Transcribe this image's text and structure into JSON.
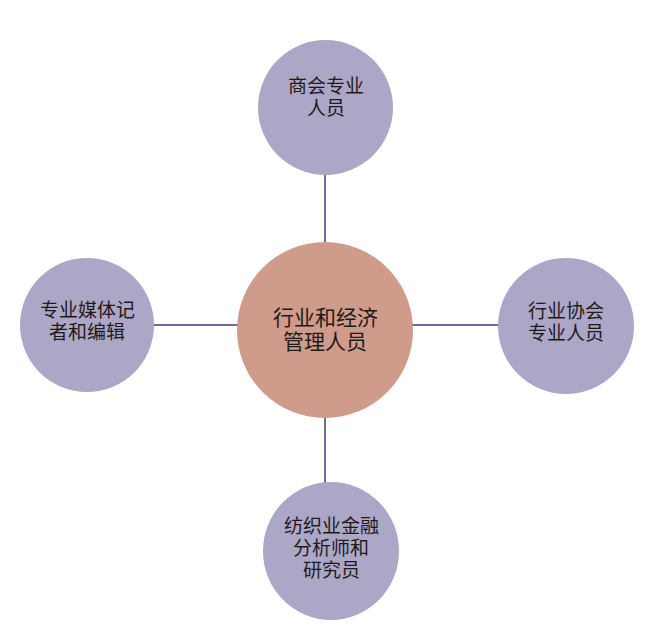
{
  "diagram": {
    "type": "hub-and-spoke",
    "colors": {
      "center_fill": "#cf9b8a",
      "satellite_fill": "#aca6c7",
      "connector": "#6f6c94",
      "background": "#ffffff"
    },
    "center": {
      "label": "行业和经济\n管理人员"
    },
    "nodes": {
      "top": {
        "label": "商会专业\n人员"
      },
      "left": {
        "label": "专业媒体记\n者和编辑"
      },
      "right": {
        "label": "行业协会\n专业人员"
      },
      "bottom": {
        "label": "纺织业金融\n分析师和\n研究员"
      }
    }
  }
}
